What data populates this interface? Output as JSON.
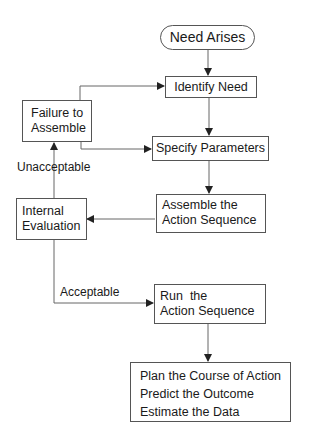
{
  "diagram": {
    "type": "flowchart",
    "nodes": {
      "start": {
        "label": "Need Arises",
        "shape": "rounded"
      },
      "identify": {
        "label": "Identify Need"
      },
      "specify": {
        "label": "Specify Parameters"
      },
      "assemble": {
        "lines": [
          "Assemble the",
          "Action Sequence"
        ]
      },
      "failure": {
        "lines": [
          "Failure to",
          "Assemble"
        ]
      },
      "evaluate": {
        "lines": [
          "Internal",
          "Evaluation"
        ]
      },
      "run": {
        "lines": [
          "Run  the",
          "Action Sequence"
        ]
      },
      "outcome": {
        "lines": [
          "Plan the Course of Action",
          "Predict the Outcome",
          "Estimate the Data"
        ]
      }
    },
    "edge_labels": {
      "unacceptable": "Unacceptable",
      "acceptable": "Acceptable"
    },
    "edges": [
      {
        "from": "start",
        "to": "identify"
      },
      {
        "from": "identify",
        "to": "specify"
      },
      {
        "from": "specify",
        "to": "assemble"
      },
      {
        "from": "assemble",
        "to": "evaluate"
      },
      {
        "from": "evaluate",
        "to": "failure",
        "label": "Unacceptable"
      },
      {
        "from": "failure",
        "to": "identify"
      },
      {
        "from": "failure",
        "to": "specify"
      },
      {
        "from": "evaluate",
        "to": "run",
        "label": "Acceptable"
      },
      {
        "from": "run",
        "to": "outcome"
      }
    ]
  }
}
